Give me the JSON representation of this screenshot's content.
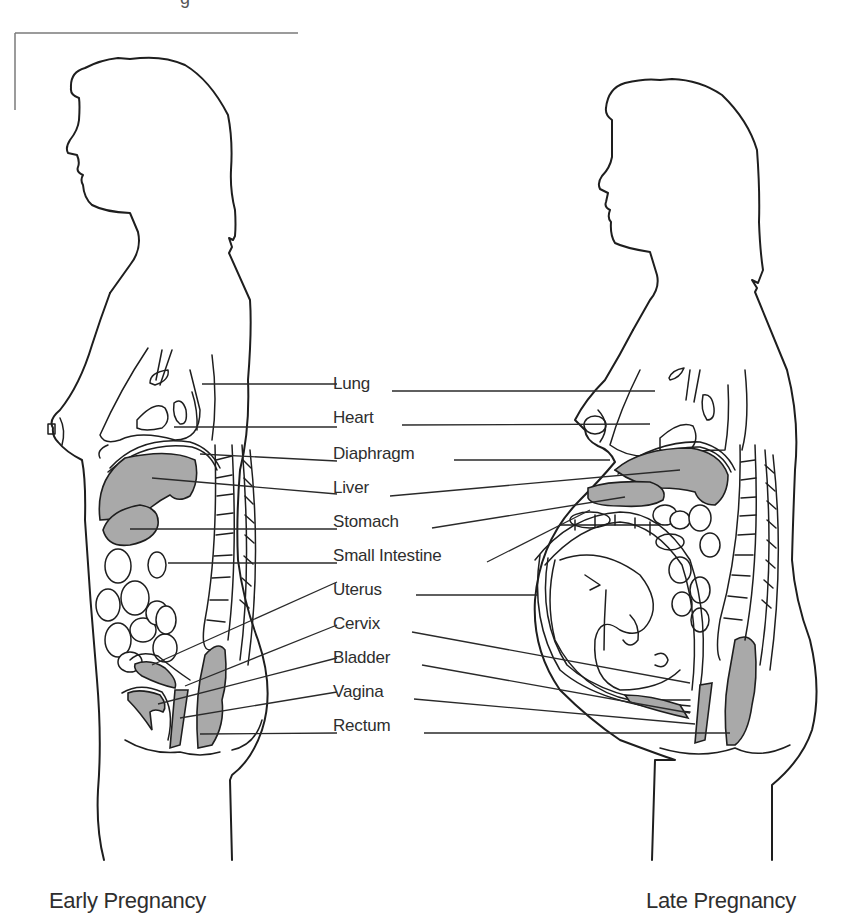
{
  "header": {
    "cut_off_title_fragment": "g"
  },
  "labels": [
    {
      "id": "lung",
      "text": "Lung",
      "x": 345,
      "y": 373
    },
    {
      "id": "heart",
      "text": "Heart",
      "x": 345,
      "y": 407
    },
    {
      "id": "diaphragm",
      "text": "Diaphragm",
      "x": 345,
      "y": 443
    },
    {
      "id": "liver",
      "text": "Liver",
      "x": 345,
      "y": 478
    },
    {
      "id": "stomach",
      "text": "Stomach",
      "x": 345,
      "y": 512
    },
    {
      "id": "small_intestine",
      "text": "Small Intestine",
      "x": 345,
      "y": 545
    },
    {
      "id": "uterus",
      "text": "Uterus",
      "x": 345,
      "y": 579
    },
    {
      "id": "cervix",
      "text": "Cervix",
      "x": 345,
      "y": 613
    },
    {
      "id": "bladder",
      "text": "Bladder",
      "x": 345,
      "y": 647
    },
    {
      "id": "vagina",
      "text": "Vagina",
      "x": 345,
      "y": 681
    },
    {
      "id": "rectum",
      "text": "Rectum",
      "x": 345,
      "y": 715
    }
  ],
  "captions": {
    "left": "Early Pregnancy",
    "right": "Late Pregnancy"
  },
  "figures": [
    {
      "id": "early",
      "title": "Early Pregnancy"
    },
    {
      "id": "late",
      "title": "Late Pregnancy"
    }
  ],
  "colors": {
    "organ_fill": "#a9a9a9",
    "line": "#1e1e1e",
    "text": "#2e2e2e",
    "background": "#ffffff"
  }
}
